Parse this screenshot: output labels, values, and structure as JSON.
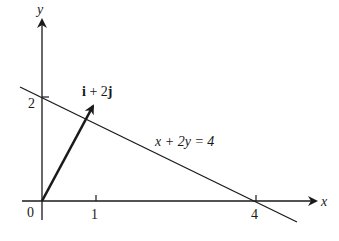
{
  "diagram": {
    "axes": {
      "x_label": "x",
      "y_label": "y",
      "origin_label": "0",
      "x_ticks": [
        {
          "value": 1,
          "label": "1"
        },
        {
          "value": 4,
          "label": "4"
        }
      ],
      "y_ticks": [
        {
          "value": 2,
          "label": "2"
        }
      ]
    },
    "line": {
      "equation_label": "x + 2y = 4",
      "x_intercept": 4,
      "y_intercept": 2
    },
    "vector": {
      "label_i": "i",
      "label_plus": " + 2",
      "label_j": "j",
      "from": [
        0,
        0
      ],
      "to": [
        1,
        2
      ]
    },
    "colors": {
      "ink": "#1a1a1a",
      "background": "#ffffff"
    }
  }
}
